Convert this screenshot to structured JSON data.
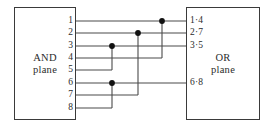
{
  "diagram": {
    "canvas": {
      "width": 274,
      "height": 132
    },
    "colors": {
      "background": "#ffffff",
      "stroke": "#3a3a3a",
      "wire": "#4a4a4a",
      "junction": "#111111",
      "text": "#2b2b2b"
    },
    "and_plane": {
      "line1": "AND",
      "line2": "plane"
    },
    "or_plane": {
      "line1": "OR",
      "line2": "plane"
    },
    "pins": [
      {
        "label": "1",
        "y": 21
      },
      {
        "label": "2",
        "y": 33
      },
      {
        "label": "3",
        "y": 46
      },
      {
        "label": "4",
        "y": 58
      },
      {
        "label": "5",
        "y": 70
      },
      {
        "label": "6",
        "y": 83
      },
      {
        "label": "7",
        "y": 95
      },
      {
        "label": "8",
        "y": 108
      }
    ],
    "outputs": [
      {
        "label": "1·4",
        "y": 21
      },
      {
        "label": "2·7",
        "y": 33
      },
      {
        "label": "3·5",
        "y": 46
      },
      {
        "label": "6·8",
        "y": 83
      }
    ],
    "junctions": [
      {
        "name": "junction-row1",
        "x": 162,
        "y": 21
      },
      {
        "name": "junction-row2",
        "x": 138,
        "y": 33
      },
      {
        "name": "junction-row3",
        "x": 112,
        "y": 46
      },
      {
        "name": "junction-row6",
        "x": 112,
        "y": 83
      }
    ],
    "geometry": {
      "and_right_edge": 76,
      "or_left_edge": 186,
      "bus_x": [
        112,
        138,
        162
      ]
    },
    "wires": {
      "horizontal": [
        {
          "name": "wire-row1",
          "y": 21,
          "x1": 76,
          "x2": 186
        },
        {
          "name": "wire-row2",
          "y": 33,
          "x1": 76,
          "x2": 186
        },
        {
          "name": "wire-row3",
          "y": 46,
          "x1": 76,
          "x2": 186
        },
        {
          "name": "wire-row4",
          "y": 58,
          "x1": 76,
          "x2": 162
        },
        {
          "name": "wire-row5",
          "y": 70,
          "x1": 76,
          "x2": 112
        },
        {
          "name": "wire-row6",
          "y": 83,
          "x1": 76,
          "x2": 186
        },
        {
          "name": "wire-row7",
          "y": 95,
          "x1": 76,
          "x2": 138
        },
        {
          "name": "wire-row8",
          "y": 108,
          "x1": 76,
          "x2": 112
        }
      ],
      "vertical": [
        {
          "name": "bus-row1-to-row4",
          "x": 162,
          "y1": 21,
          "y2": 58
        },
        {
          "name": "bus-row2-to-row7",
          "x": 138,
          "y1": 33,
          "y2": 95
        },
        {
          "name": "bus-row3-to-row5",
          "x": 112,
          "y1": 46,
          "y2": 70
        },
        {
          "name": "bus-row6-to-row8",
          "x": 112,
          "y1": 83,
          "y2": 108
        }
      ]
    }
  }
}
